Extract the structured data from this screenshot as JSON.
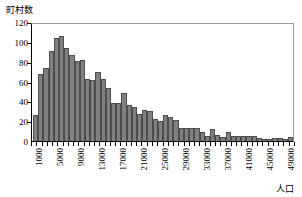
{
  "chart_data": {
    "type": "bar",
    "title": "",
    "subtitle": "",
    "xlabel": "人口",
    "ylabel": "町村数",
    "ylim": [
      0,
      120
    ],
    "ytick_values": [
      0,
      20,
      40,
      60,
      80,
      100,
      120
    ],
    "ytick_labels": [
      "0",
      "20",
      "40",
      "60",
      "80",
      "100",
      "120"
    ],
    "grid": false,
    "legend": null,
    "bin_width": 1000,
    "x_start": 1000,
    "xtick_labels": [
      "1000",
      "5000",
      "9000",
      "13000",
      "17000",
      "21000",
      "25000",
      "29000",
      "33000",
      "37000",
      "41000",
      "45000",
      "49000"
    ],
    "xtick_bin_index": [
      0,
      4,
      8,
      12,
      16,
      20,
      24,
      28,
      32,
      36,
      40,
      44,
      48
    ],
    "categories": [
      "1000",
      "2000",
      "3000",
      "4000",
      "5000",
      "6000",
      "7000",
      "8000",
      "9000",
      "10000",
      "11000",
      "12000",
      "13000",
      "14000",
      "15000",
      "16000",
      "17000",
      "18000",
      "19000",
      "20000",
      "21000",
      "22000",
      "23000",
      "24000",
      "25000",
      "26000",
      "27000",
      "28000",
      "29000",
      "30000",
      "31000",
      "32000",
      "33000",
      "34000",
      "35000",
      "36000",
      "37000",
      "38000",
      "39000",
      "40000",
      "41000",
      "42000",
      "43000",
      "44000",
      "45000",
      "46000",
      "47000",
      "48000",
      "49000",
      "50000"
    ],
    "values": [
      26,
      68,
      74,
      91,
      104,
      106,
      94,
      87,
      81,
      82,
      63,
      62,
      70,
      63,
      53,
      38,
      38,
      48,
      36,
      34,
      27,
      31,
      30,
      22,
      20,
      26,
      24,
      21,
      13,
      13,
      13,
      13,
      9,
      5,
      12,
      6,
      4,
      9,
      5,
      5,
      5,
      5,
      5,
      3,
      2,
      2,
      3,
      3,
      2,
      4
    ],
    "bar_color": "#808080",
    "bar_edge_color": "#4d4d4d",
    "axis_color": "#000000"
  }
}
